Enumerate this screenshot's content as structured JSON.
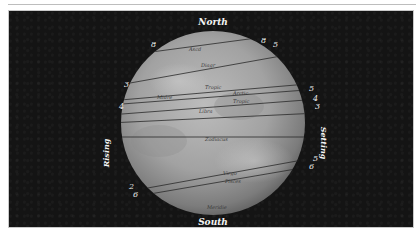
{
  "figure": {
    "compass": {
      "north": "North",
      "south": "South",
      "rising": "Rising",
      "setting": "Setting"
    },
    "left_numbers": [
      "8",
      "3",
      "4",
      "2",
      "6"
    ],
    "right_numbers": [
      "8",
      "5",
      "5",
      "4",
      "3",
      "5",
      "6"
    ],
    "inner_labels": [
      "Ascd",
      "Diagr",
      "Tropic",
      "Midre",
      "Arctic",
      "Tropic",
      "Libra",
      "Zodiacus",
      "Virgo",
      "Pisces",
      "Meridie"
    ],
    "colors": {
      "background": "#141414",
      "sphere_light": "#b9b9b9",
      "sphere_dark": "#5f5f5f",
      "lines": "#2a2a2a",
      "labels": "#f4f4f4",
      "frame_border": "#c9c9c9"
    }
  }
}
